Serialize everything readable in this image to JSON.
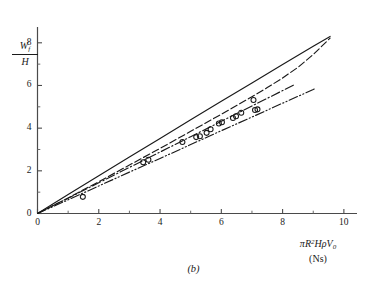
{
  "figure": {
    "caption": "(b)",
    "background": "#ffffff",
    "ink_color": "#1a1a1a"
  },
  "axes": {
    "x": {
      "label_expression": "πR²HρV₀",
      "label_units": "(Ns)",
      "label_parts": {
        "pi": "π",
        "R": "R",
        "R_exp": "2",
        "H": "H",
        "rho": "ρ",
        "V": "V",
        "V_sub": "0"
      },
      "ticks": [
        "0",
        "2",
        "4",
        "6",
        "8",
        "10"
      ],
      "tick_values": [
        0,
        2,
        4,
        6,
        8,
        10
      ],
      "minor_tick_values": [
        1,
        3,
        5,
        7,
        9
      ],
      "range": [
        0,
        10.2
      ]
    },
    "y": {
      "label_numerator": "W",
      "label_numerator_sub": "f",
      "label_denominator": "H",
      "label_expression": "Wₑ/H",
      "ticks": [
        "0",
        "2",
        "4",
        "6",
        "8"
      ],
      "tick_values": [
        0,
        2,
        4,
        6,
        8
      ],
      "minor_tick_values": [
        1,
        3,
        5,
        7
      ],
      "range": [
        0,
        8.6
      ]
    }
  },
  "chart_data": {
    "type": "line",
    "title": "",
    "subtitle": "",
    "xlabel": "πR²HρV₀ (Ns)",
    "ylabel": "Wₑ/H",
    "xlim": [
      0,
      10.2
    ],
    "ylim": [
      0,
      8.6
    ],
    "grid": false,
    "legend": "none",
    "annotations": [
      "(b)"
    ],
    "series": [
      {
        "name": "solid-curve",
        "style": "solid",
        "color": "#1a1a1a",
        "x": [
          0.0,
          1.0,
          2.0,
          3.0,
          4.0,
          5.0,
          6.0,
          7.0,
          8.0,
          9.0,
          9.55
        ],
        "y": [
          0.0,
          0.89,
          1.77,
          2.65,
          3.52,
          4.39,
          5.26,
          6.12,
          6.98,
          7.84,
          8.3
        ]
      },
      {
        "name": "dashed-curve",
        "style": "dashed",
        "color": "#1a1a1a",
        "x": [
          0.0,
          1.0,
          2.0,
          3.0,
          4.0,
          5.0,
          6.0,
          7.0,
          7.5,
          8.0,
          8.5,
          9.0,
          9.55
        ],
        "y": [
          0.0,
          0.73,
          1.49,
          2.27,
          3.05,
          3.85,
          4.65,
          5.47,
          5.9,
          6.35,
          6.85,
          7.45,
          8.22
        ]
      },
      {
        "name": "dash-dot-curve",
        "style": "dash-dot",
        "color": "#1a1a1a",
        "x": [
          0.0,
          1.0,
          2.0,
          3.0,
          4.0,
          5.0,
          6.0,
          7.0,
          7.6,
          8.0,
          8.4
        ],
        "y": [
          0.0,
          0.72,
          1.44,
          2.16,
          2.88,
          3.6,
          4.32,
          5.04,
          5.47,
          5.76,
          6.05
        ]
      },
      {
        "name": "dash-dot-dot-curve",
        "style": "dash-dot-dot",
        "color": "#1a1a1a",
        "x": [
          0.0,
          1.0,
          2.0,
          3.0,
          4.0,
          5.0,
          6.0,
          7.0,
          8.0,
          9.0,
          9.1
        ],
        "y": [
          0.0,
          0.64,
          1.29,
          1.94,
          2.58,
          3.23,
          3.88,
          4.52,
          5.17,
          5.81,
          5.88
        ]
      }
    ],
    "scatter": {
      "name": "measured-points",
      "marker": "open-circle",
      "marker_size": 5,
      "color": "#1a1a1a",
      "points": [
        {
          "x": 1.48,
          "y": 0.78
        },
        {
          "x": 3.45,
          "y": 2.4
        },
        {
          "x": 3.62,
          "y": 2.52
        },
        {
          "x": 4.73,
          "y": 3.35
        },
        {
          "x": 5.18,
          "y": 3.58
        },
        {
          "x": 5.3,
          "y": 3.62
        },
        {
          "x": 5.52,
          "y": 3.78
        },
        {
          "x": 5.65,
          "y": 3.95
        },
        {
          "x": 5.92,
          "y": 4.22
        },
        {
          "x": 6.02,
          "y": 4.28
        },
        {
          "x": 6.38,
          "y": 4.48
        },
        {
          "x": 6.48,
          "y": 4.56
        },
        {
          "x": 6.65,
          "y": 4.72
        },
        {
          "x": 7.05,
          "y": 5.32
        },
        {
          "x": 7.1,
          "y": 4.85
        },
        {
          "x": 7.18,
          "y": 4.88
        }
      ]
    }
  }
}
